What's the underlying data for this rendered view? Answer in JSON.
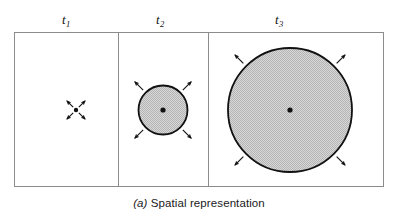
{
  "figure": {
    "caption_tag": "(a)",
    "caption_text": " Spatial representation",
    "caption_full": "(a) Spatial representation",
    "background_color": "#ffffff",
    "frame_color": "#8c8c8c",
    "ink_color": "#111111",
    "fill_color": "#cfcfcf"
  },
  "panels": [
    {
      "id": "panel-t1",
      "label_base": "t",
      "label_sub": "1",
      "label_x": 66,
      "label_y": 13,
      "frame": {
        "x": 14,
        "y": 32,
        "width": 104,
        "height": 154
      },
      "circle": {
        "cx": 76,
        "cy": 110,
        "r": 1.0,
        "filled": false
      },
      "center_dot": {
        "cx": 76,
        "cy": 110,
        "r": 2.2
      },
      "arrows": {
        "count": 4,
        "inner_radius": 4,
        "outer_radius": 13,
        "head_size": 4.2
      }
    },
    {
      "id": "panel-t2",
      "label_base": "t",
      "label_sub": "2",
      "label_x": 160,
      "label_y": 13,
      "frame": {
        "x": 118,
        "y": 32,
        "width": 90,
        "height": 154
      },
      "circle": {
        "cx": 163,
        "cy": 110,
        "r": 24.5,
        "filled": true
      },
      "center_dot": {
        "cx": 163,
        "cy": 110,
        "r": 2.6
      },
      "arrows": {
        "count": 4,
        "inner_radius": 28,
        "outer_radius": 40,
        "head_size": 4.6
      }
    },
    {
      "id": "panel-t3",
      "label_base": "t",
      "label_sub": "3",
      "label_x": 279,
      "label_y": 13,
      "frame": {
        "x": 208,
        "y": 32,
        "width": 175,
        "height": 154
      },
      "circle": {
        "cx": 290,
        "cy": 110,
        "r": 62,
        "filled": true
      },
      "center_dot": {
        "cx": 290,
        "cy": 110,
        "r": 2.6
      },
      "arrows": {
        "count": 4,
        "inner_radius": 66,
        "outer_radius": 78,
        "head_size": 4.8
      }
    }
  ],
  "chart_data": {
    "type": "diagram",
    "title": "(a) Spatial representation",
    "categories": [
      "t1",
      "t2",
      "t3"
    ],
    "radii": [
      1.0,
      24.5,
      62
    ],
    "units": "pixels",
    "arrow_directions": [
      "up-left",
      "up-right",
      "down-left",
      "down-right"
    ],
    "legend": []
  }
}
